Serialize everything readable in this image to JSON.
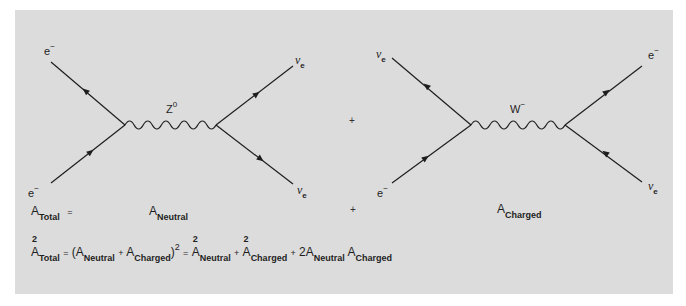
{
  "figure": {
    "background_color": "#dcdcdc",
    "line_color": "#1e1e1e"
  },
  "diagram_neutral": {
    "name": "Neutral current (Z0 exchange)",
    "boson": {
      "symbol": "Z",
      "superscript": "0"
    },
    "particles": {
      "top_left": {
        "symbol": "e",
        "superscript": "−"
      },
      "bottom_left": {
        "symbol": "e",
        "superscript": "−"
      },
      "top_right": {
        "symbol": "ν",
        "subscript": "e"
      },
      "bottom_right": {
        "symbol": "ν",
        "subscript": "e"
      }
    },
    "amplitude_label": {
      "base": "A",
      "subscript": "Neutral"
    }
  },
  "diagram_charged": {
    "name": "Charged current (W− exchange)",
    "boson": {
      "symbol": "W",
      "superscript": "−"
    },
    "particles": {
      "top_left": {
        "symbol": "ν",
        "subscript": "e"
      },
      "bottom_left": {
        "symbol": "e",
        "superscript": "−"
      },
      "top_right": {
        "symbol": "e",
        "superscript": "−"
      },
      "bottom_right": {
        "symbol": "ν",
        "subscript": "e"
      }
    },
    "amplitude_label": {
      "base": "A",
      "subscript": "Charged"
    }
  },
  "operators": {
    "plus": "+",
    "equals": "="
  },
  "equation1": {
    "lhs": {
      "base": "A",
      "subscript": "Total"
    },
    "equals": "="
  },
  "equation2": {
    "lhs": {
      "base": "A",
      "subscript": "Total",
      "power": "2"
    },
    "equals": "=",
    "open_paren": "(",
    "term1": {
      "base": "A",
      "subscript": "Neutral"
    },
    "plus": "+",
    "term2": {
      "base": "A",
      "subscript": "Charged"
    },
    "close_paren": ")",
    "paren_power": "2",
    "rhs_terms": [
      {
        "base": "A",
        "subscript": "Neutral",
        "power": "2"
      },
      {
        "base": "A",
        "subscript": "Charged",
        "power": "2"
      },
      {
        "coefficient": "2",
        "base": "A",
        "subscript": "Neutral"
      },
      {
        "base": "A",
        "subscript": "Charged"
      }
    ]
  }
}
